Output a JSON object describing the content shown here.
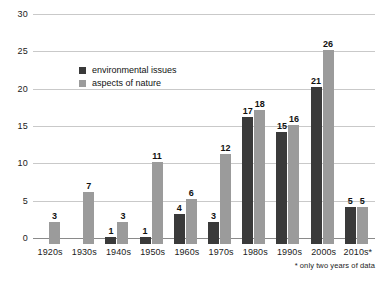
{
  "chart_data": {
    "type": "bar",
    "title": "",
    "subtitle": "",
    "xlabel": "",
    "ylabel": "",
    "ylim": [
      0,
      30
    ],
    "yticks": [
      0,
      5,
      10,
      15,
      20,
      25,
      30
    ],
    "grid": true,
    "legend_position": "inside-upper-left",
    "categories": [
      "1920s",
      "1930s",
      "1940s",
      "1950s",
      "1960s",
      "1970s",
      "1980s",
      "1990s",
      "2000s",
      "2010s*"
    ],
    "series": [
      {
        "name": "environmental issues",
        "color": "#3a3a3a",
        "values": [
          0,
          0,
          1,
          1,
          4,
          3,
          17,
          15,
          21,
          5
        ],
        "labels": [
          "",
          "",
          "1",
          "1",
          "4",
          "3",
          "17",
          "15",
          "21",
          "5"
        ]
      },
      {
        "name": "aspects of nature",
        "color": "#9b9b9b",
        "values": [
          3,
          7,
          3,
          11,
          6,
          12,
          18,
          16,
          26,
          5
        ],
        "labels": [
          "3",
          "7",
          "3",
          "11",
          "6",
          "12",
          "18",
          "16",
          "26",
          "5"
        ]
      }
    ],
    "annotations": [
      "* only two years of data"
    ]
  },
  "legend": {
    "items": [
      {
        "label": "environmental issues",
        "swatch": "dark"
      },
      {
        "label": "aspects of nature",
        "swatch": "light"
      }
    ]
  },
  "footnote": "* only two years of data"
}
